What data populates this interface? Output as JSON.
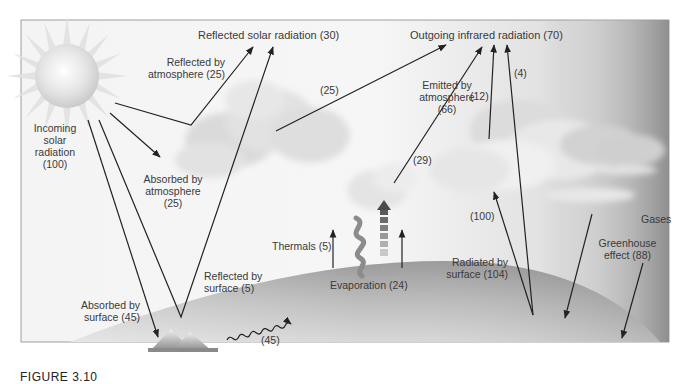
{
  "figure": {
    "caption": "FIGURE 3.10"
  },
  "labels": {
    "reflected_solar": "Reflected solar radiation (30)",
    "outgoing_ir": "Outgoing infrared radiation (70)",
    "reflected_by_atmosphere_1": "Reflected by",
    "reflected_by_atmosphere_2": "atmosphere (25)",
    "incoming_1": "Incoming",
    "incoming_2": "solar",
    "incoming_3": "radiation",
    "incoming_4": "(100)",
    "absorbed_atm_1": "Absorbed by",
    "absorbed_atm_2": "atmosphere",
    "absorbed_atm_3": "(25)",
    "value_25_upper": "(25)",
    "emitted_atm_1": "Emitted by",
    "emitted_atm_2": "atmosphere",
    "emitted_atm_3": "(66)",
    "value_12": "(12)",
    "value_4": "(4)",
    "value_29": "(29)",
    "value_100": "(100)",
    "gases": "Gases",
    "greenhouse_1": "Greenhouse",
    "greenhouse_2": "effect (88)",
    "radiated_surface_1": "Radiated by",
    "radiated_surface_2": "surface (104)",
    "thermals": "Thermals (5)",
    "evaporation": "Evaporation (24)",
    "reflected_surface_1": "Reflected by",
    "reflected_surface_2": "surface (5)",
    "absorbed_surface_1": "Absorbed by",
    "absorbed_surface_2": "surface (45)",
    "value_45_wavy": "(45)"
  },
  "flows": [
    {
      "name": "incoming-solar",
      "value": 100
    },
    {
      "name": "reflected-by-atmosphere",
      "value": 25
    },
    {
      "name": "absorbed-by-atmosphere",
      "value": 25
    },
    {
      "name": "reflected-by-surface",
      "value": 5
    },
    {
      "name": "absorbed-by-surface",
      "value": 45
    },
    {
      "name": "reflected-solar-total",
      "value": 30
    },
    {
      "name": "outgoing-infrared-total",
      "value": 70
    },
    {
      "name": "emitted-by-atmosphere",
      "value": 66
    },
    {
      "name": "atmosphere-to-space",
      "value": 25
    },
    {
      "name": "cloud-to-space-a",
      "value": 29
    },
    {
      "name": "cloud-to-space-b",
      "value": 12
    },
    {
      "name": "surface-to-space",
      "value": 4
    },
    {
      "name": "surface-to-atmosphere",
      "value": 100
    },
    {
      "name": "radiated-by-surface",
      "value": 104
    },
    {
      "name": "greenhouse-effect",
      "value": 88
    },
    {
      "name": "thermals",
      "value": 5
    },
    {
      "name": "evaporation",
      "value": 24
    },
    {
      "name": "surface-heat",
      "value": 45
    }
  ]
}
